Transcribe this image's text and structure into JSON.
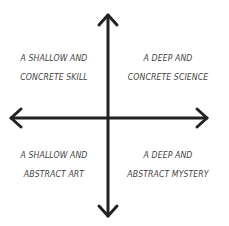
{
  "diagram": {
    "type": "2x2 quadrant",
    "axes": {
      "horizontal": {
        "arrows": [
          "left",
          "right"
        ]
      },
      "vertical": {
        "arrows": [
          "up",
          "down"
        ]
      },
      "stroke_color": "#222222"
    },
    "quadrants": {
      "top_left": {
        "line1": "A SHALLOW AND",
        "line2": "CONCRETE SKILL"
      },
      "top_right": {
        "line1": "A DEEP AND",
        "line2": "CONCRETE SCIENCE"
      },
      "bottom_left": {
        "line1": "A SHALLOW AND",
        "line2": "ABSTRACT ART"
      },
      "bottom_right": {
        "line1": "A DEEP AND",
        "line2": "ABSTRACT MYSTERY"
      }
    },
    "text_color": "#444444",
    "background": "#ffffff"
  }
}
